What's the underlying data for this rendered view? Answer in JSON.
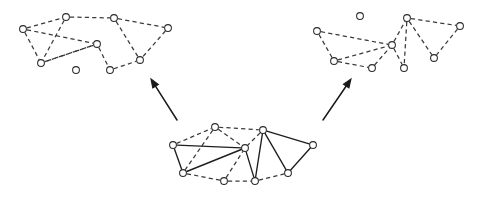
{
  "figure": {
    "width": 482,
    "height": 199,
    "background_color": "#ffffff",
    "colors": {
      "node_stroke": "#2b2b2b",
      "node_fill": "#ffffff",
      "dashed_edge": "#3a3a3a",
      "solid_edge": "#1e1e1e",
      "arrow": "#1a1a1a"
    },
    "node_radius": 3.4
  },
  "graphs": [
    {
      "id": "graph-top-left",
      "name": "top-left-graph",
      "nodes": [
        {
          "id": "L0",
          "x": 23,
          "y": 29
        },
        {
          "id": "L1",
          "x": 66,
          "y": 17
        },
        {
          "id": "L2",
          "x": 114,
          "y": 18
        },
        {
          "id": "L3",
          "x": 168,
          "y": 28
        },
        {
          "id": "L4",
          "x": 97,
          "y": 44
        },
        {
          "id": "L5",
          "x": 41,
          "y": 63
        },
        {
          "id": "L6",
          "x": 110,
          "y": 70
        },
        {
          "id": "L7",
          "x": 140,
          "y": 60
        },
        {
          "id": "L8",
          "x": 76,
          "y": 70,
          "isolated": true
        }
      ],
      "dashed_edges": [
        [
          "L0",
          "L1"
        ],
        [
          "L1",
          "L2"
        ],
        [
          "L2",
          "L3"
        ],
        [
          "L0",
          "L5"
        ],
        [
          "L1",
          "L5"
        ],
        [
          "L0",
          "L4"
        ],
        [
          "L4",
          "L5"
        ],
        [
          "L4",
          "L6"
        ],
        [
          "L2",
          "L7"
        ],
        [
          "L3",
          "L7"
        ],
        [
          "L6",
          "L7"
        ],
        [
          "L5",
          "L4"
        ]
      ],
      "solid_edges": []
    },
    {
      "id": "graph-top-right",
      "name": "top-right-graph",
      "nodes": [
        {
          "id": "R0",
          "x": 317,
          "y": 31
        },
        {
          "id": "R1",
          "x": 334,
          "y": 61
        },
        {
          "id": "R2",
          "x": 372,
          "y": 68
        },
        {
          "id": "R3",
          "x": 392,
          "y": 45
        },
        {
          "id": "R4",
          "x": 407,
          "y": 18
        },
        {
          "id": "R5",
          "x": 460,
          "y": 26
        },
        {
          "id": "R6",
          "x": 434,
          "y": 58
        },
        {
          "id": "R7",
          "x": 404,
          "y": 68
        },
        {
          "id": "R8",
          "x": 360,
          "y": 16,
          "isolated": true
        }
      ],
      "dashed_edges": [
        [
          "R0",
          "R1"
        ],
        [
          "R0",
          "R3"
        ],
        [
          "R1",
          "R3"
        ],
        [
          "R1",
          "R2"
        ],
        [
          "R2",
          "R3"
        ],
        [
          "R3",
          "R4"
        ],
        [
          "R3",
          "R7"
        ],
        [
          "R4",
          "R5"
        ],
        [
          "R4",
          "R6"
        ],
        [
          "R4",
          "R7"
        ],
        [
          "R5",
          "R6"
        ]
      ],
      "solid_edges": []
    },
    {
      "id": "graph-bottom-center",
      "name": "bottom-center-source-graph",
      "nodes": [
        {
          "id": "B0",
          "x": 173,
          "y": 145
        },
        {
          "id": "B1",
          "x": 215,
          "y": 127
        },
        {
          "id": "B2",
          "x": 263,
          "y": 130
        },
        {
          "id": "B3",
          "x": 313,
          "y": 145
        },
        {
          "id": "B4",
          "x": 245,
          "y": 148
        },
        {
          "id": "B5",
          "x": 183,
          "y": 173
        },
        {
          "id": "B6",
          "x": 224,
          "y": 181
        },
        {
          "id": "B7",
          "x": 255,
          "y": 181
        },
        {
          "id": "B8",
          "x": 288,
          "y": 173
        }
      ],
      "solid_edges": [
        [
          "B0",
          "B5"
        ],
        [
          "B0",
          "B4"
        ],
        [
          "B4",
          "B5"
        ],
        [
          "B2",
          "B3"
        ],
        [
          "B2",
          "B8"
        ],
        [
          "B3",
          "B8"
        ],
        [
          "B2",
          "B7"
        ],
        [
          "B4",
          "B7"
        ]
      ],
      "dashed_edges": [
        [
          "B0",
          "B1"
        ],
        [
          "B1",
          "B2"
        ],
        [
          "B1",
          "B5"
        ],
        [
          "B1",
          "B4"
        ],
        [
          "B5",
          "B6"
        ],
        [
          "B6",
          "B4"
        ],
        [
          "B2",
          "B4"
        ],
        [
          "B7",
          "B8"
        ],
        [
          "B6",
          "B7"
        ]
      ]
    }
  ],
  "arrows": [
    {
      "id": "arrow-to-top-left",
      "name": "arrow-bottom-to-top-left",
      "from": {
        "x": 177,
        "y": 120
      },
      "to": {
        "x": 151,
        "y": 79
      },
      "direction": "up-left"
    },
    {
      "id": "arrow-to-top-right",
      "name": "arrow-bottom-to-top-right",
      "from": {
        "x": 323,
        "y": 120
      },
      "to": {
        "x": 351,
        "y": 79
      },
      "direction": "up-right"
    }
  ]
}
